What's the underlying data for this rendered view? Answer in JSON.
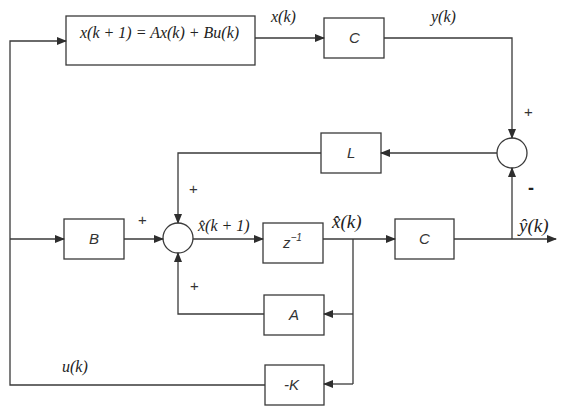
{
  "diagram": {
    "colors": {
      "line": "#3a3a3a",
      "background": "#ffffff",
      "text": "#222222"
    },
    "blocks": {
      "plant": {
        "label": "x(k + 1) = Ax(k) + Bu(k)"
      },
      "output_c": {
        "label": "C"
      },
      "observer_gain": {
        "label": "L"
      },
      "input_b": {
        "label": "B"
      },
      "delay": {
        "label_base": "z",
        "label_exp": "−1"
      },
      "estimate_c": {
        "label": "C"
      },
      "state_a": {
        "label": "A"
      },
      "feedback_gain": {
        "label": "-K"
      }
    },
    "signals": {
      "x_k": "x(k)",
      "y_k": "y(k)",
      "xhat_k1": "x̂(k + 1)",
      "xhat_k": "x̂(k)",
      "yhat_k": "ŷ(k)",
      "u_k": "u(k)"
    },
    "signs": {
      "error_sum_top": "+",
      "error_sum_bottom": "-",
      "observer_sum_top": "+",
      "observer_sum_left": "+",
      "observer_sum_bottom": "+"
    },
    "summing_junctions": [
      "error-summing-junction",
      "observer-summing-junction"
    ]
  }
}
